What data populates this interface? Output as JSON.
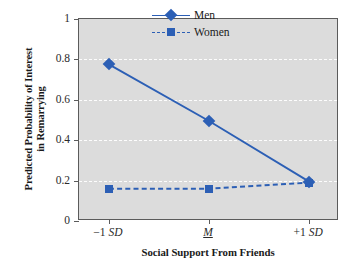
{
  "chart_data": {
    "type": "line",
    "title": "",
    "subtitle": "",
    "xlabel": "Social Support From Friends",
    "ylabel_line1": "Predicted Probability of Interest",
    "ylabel_line2": "in Remarrying",
    "categories": [
      "−1 SD",
      "M",
      "+1 SD"
    ],
    "x_tick_labels": [
      {
        "prefix": "−1 ",
        "italic": "SD",
        "underline": false
      },
      {
        "prefix": "",
        "italic": "M",
        "underline": true
      },
      {
        "prefix": "+1 ",
        "italic": "SD",
        "underline": false
      }
    ],
    "y_tick_labels": [
      "1",
      "0.8",
      "0.6",
      "0.4",
      "0.2",
      "0"
    ],
    "y_tick_values": [
      1,
      0.8,
      0.6,
      0.4,
      0.2,
      0
    ],
    "ylim": [
      0,
      1
    ],
    "grid": true,
    "grid_axis": "y",
    "legend_position": "top-right",
    "series": [
      {
        "name": "Men",
        "values": [
          0.775,
          0.495,
          0.195
        ],
        "marker": "diamond",
        "linestyle": "solid",
        "color": "#2C5FB5"
      },
      {
        "name": "Women",
        "values": [
          0.16,
          0.16,
          0.19
        ],
        "marker": "square",
        "linestyle": "dashed",
        "color": "#2C5FB5"
      }
    ]
  },
  "legend": {
    "items": [
      {
        "label": "Men",
        "marker": "diamond-marker",
        "linestyle": "solid"
      },
      {
        "label": "Women",
        "marker": "square-marker",
        "linestyle": "dashed"
      }
    ]
  },
  "colors": {
    "series": "#2C5FB5",
    "plot_background": "#DCDCDC",
    "axis": "#5B5B5B",
    "gridline": "#FFFFFF",
    "page_background": "#FFFFFF",
    "text": "#1A1A1A"
  }
}
